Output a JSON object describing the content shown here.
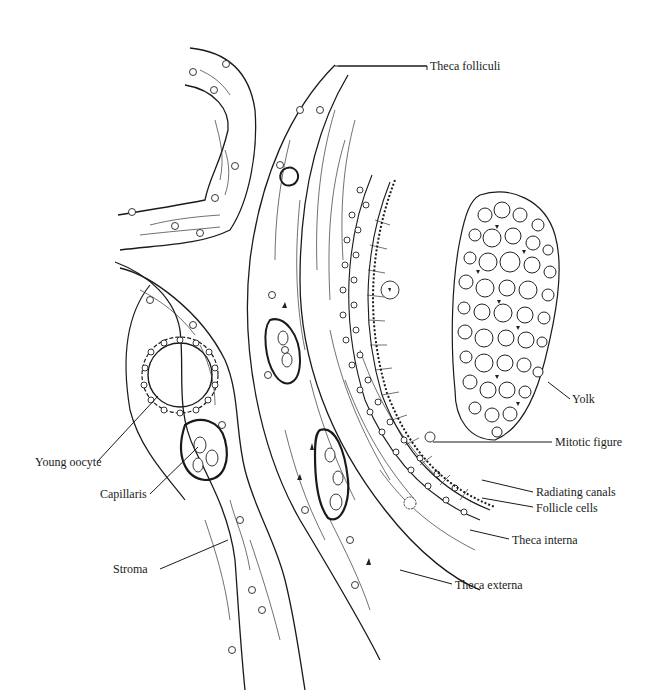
{
  "figure": {
    "labels": [
      {
        "id": "theca-folliculi",
        "text": "Theca folliculi",
        "x": 430,
        "y": 62
      },
      {
        "id": "yolk",
        "text": "Yolk",
        "x": 572,
        "y": 395
      },
      {
        "id": "mitotic-figure",
        "text": "Mitotic figure",
        "x": 555,
        "y": 437
      },
      {
        "id": "radiating-canals",
        "text": "Radiating canals",
        "x": 536,
        "y": 487
      },
      {
        "id": "follicle-cells",
        "text": "Follicle cells",
        "x": 536,
        "y": 503
      },
      {
        "id": "theca-interna",
        "text": "Theca interna",
        "x": 512,
        "y": 535
      },
      {
        "id": "theca-externa",
        "text": "Theca externa",
        "x": 455,
        "y": 580
      },
      {
        "id": "young-oocyte",
        "text": "Young oocyte",
        "x": 35,
        "y": 458
      },
      {
        "id": "capillaris",
        "text": "Capillaris",
        "x": 100,
        "y": 490
      },
      {
        "id": "stroma",
        "text": "Stroma",
        "x": 113,
        "y": 565
      }
    ]
  },
  "colors": {
    "ink": "#1a1a1a",
    "background": "#ffffff"
  }
}
